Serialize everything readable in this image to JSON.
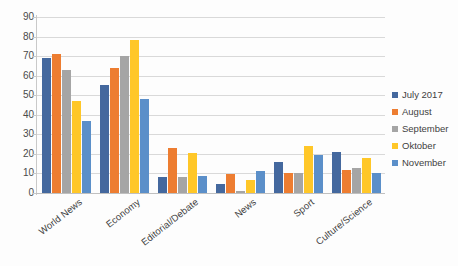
{
  "chart_data": {
    "type": "bar",
    "title": "",
    "xlabel": "",
    "ylabel": "",
    "ylim": [
      0,
      90
    ],
    "ytick_step": 10,
    "yticks": [
      90,
      80,
      70,
      60,
      50,
      40,
      30,
      20,
      10,
      0
    ],
    "grid": true,
    "legend_position": "right",
    "categories": [
      "World News",
      "Economy",
      "Editorial/Debate",
      "News",
      "Sport",
      "Culture/Science"
    ],
    "series": [
      {
        "name": "July 2017",
        "color": "#44689e",
        "values": [
          69,
          55,
          8,
          4.5,
          16,
          21
        ]
      },
      {
        "name": "August",
        "color": "#ed7d31",
        "values": [
          71,
          64,
          23,
          9.5,
          10,
          12
        ]
      },
      {
        "name": "September",
        "color": "#a5a5a5",
        "values": [
          63,
          70,
          8,
          1,
          10,
          13
        ]
      },
      {
        "name": "Oktober",
        "color": "#ffc728",
        "values": [
          47,
          78,
          20.5,
          6.5,
          24,
          18
        ]
      },
      {
        "name": "November",
        "color": "#5b8fc9",
        "values": [
          37,
          48,
          8.5,
          11.5,
          19.5,
          10
        ]
      }
    ]
  },
  "legend": {
    "items": [
      {
        "label": "July 2017",
        "color": "#44689e"
      },
      {
        "label": "August",
        "color": "#ed7d31"
      },
      {
        "label": "September",
        "color": "#a5a5a5"
      },
      {
        "label": "Oktober",
        "color": "#ffc728"
      },
      {
        "label": "November",
        "color": "#5b8fc9"
      }
    ]
  },
  "caption": ""
}
